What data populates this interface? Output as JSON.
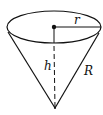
{
  "diagram": {
    "labels": {
      "radius": "r",
      "height": "h",
      "slant": "R"
    },
    "colors": {
      "stroke": "#111111",
      "background": "#ffffff"
    }
  }
}
